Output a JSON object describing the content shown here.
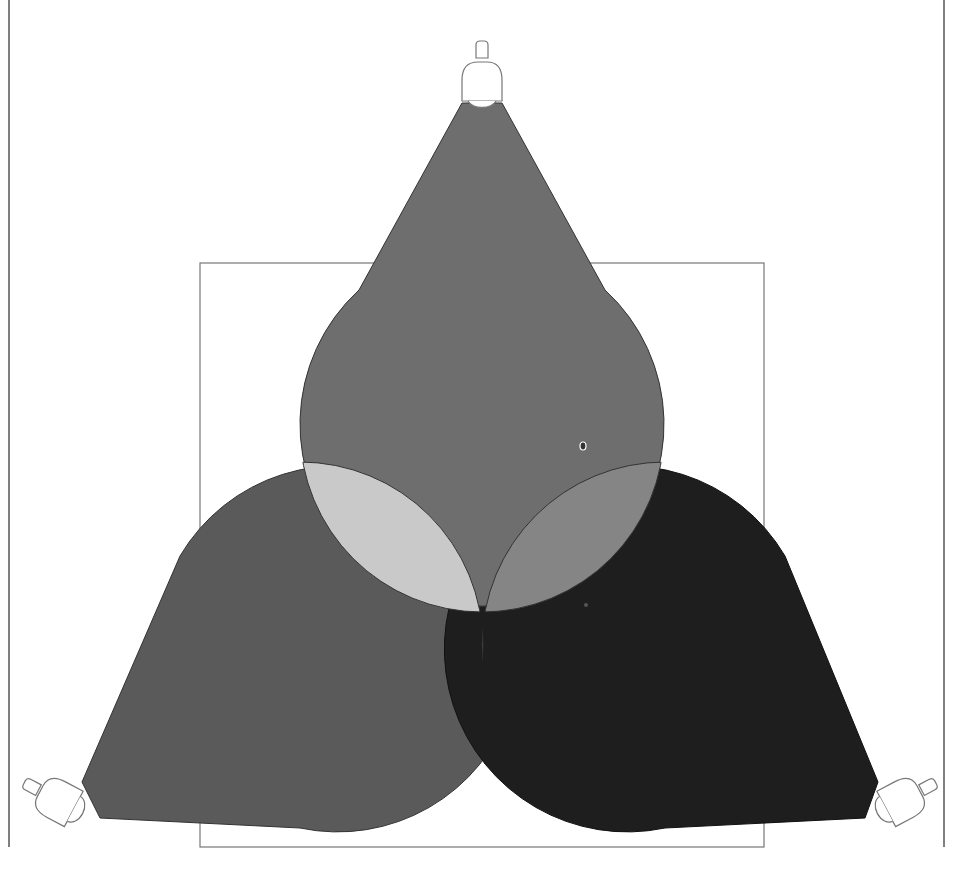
{
  "diagram": {
    "title": "Three overlapping spotlights (light mixing)",
    "frame": {
      "stroke": "#555555"
    },
    "stage_rect": {
      "stroke": "#666666"
    },
    "beams": [
      {
        "id": "top",
        "label": "Top spotlight beam",
        "fill": "#6e6e6e"
      },
      {
        "id": "left",
        "label": "Left spotlight beam",
        "fill": "#5a5a5a"
      },
      {
        "id": "right",
        "label": "Right spotlight beam",
        "fill": "#1e1e1e"
      }
    ],
    "overlaps": {
      "top_left": {
        "label": "Top + Left overlap",
        "fill": "#c9c9c9"
      },
      "top_right": {
        "label": "Top + Right overlap",
        "fill": "#858585"
      },
      "left_right": {
        "label": "Left + Right overlap",
        "fill": "#7c7c7c"
      },
      "all_three": {
        "label": "All three overlap",
        "fill": "#ffffff"
      }
    },
    "lamps": [
      {
        "id": "top",
        "label": "Top spotlight"
      },
      {
        "id": "left",
        "label": "Left spotlight"
      },
      {
        "id": "right",
        "label": "Right spotlight"
      }
    ]
  }
}
